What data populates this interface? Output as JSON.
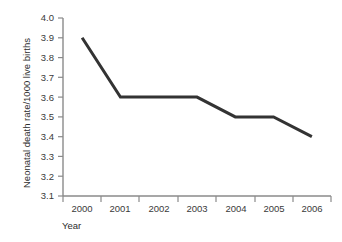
{
  "chart_data": {
    "type": "line",
    "title": "",
    "xlabel": "Year",
    "ylabel": "Neonatal death rate/1000 live births",
    "categories": [
      "2000",
      "2001",
      "2002",
      "2003",
      "2004",
      "2005",
      "2006"
    ],
    "values": [
      3.9,
      3.6,
      3.6,
      3.6,
      3.5,
      3.5,
      3.4
    ],
    "series": [
      {
        "name": "Neonatal death rate",
        "values": [
          3.9,
          3.6,
          3.6,
          3.6,
          3.5,
          3.5,
          3.4
        ]
      }
    ],
    "x": [
      2000,
      2001,
      2002,
      2003,
      2004,
      2005,
      2006
    ],
    "ylim": [
      3.1,
      4.0
    ],
    "ytick_labels": [
      "4.0",
      "3.9",
      "3.8",
      "3.7",
      "3.6",
      "3.5",
      "3.4",
      "3.3",
      "3.2",
      "3.1"
    ],
    "ytick_values": [
      4.0,
      3.9,
      3.8,
      3.7,
      3.6,
      3.5,
      3.4,
      3.3,
      3.2,
      3.1
    ],
    "ytick_step": 0.1,
    "grid": false,
    "legend": false,
    "legend_position": "none",
    "annotations": [],
    "colors": {
      "line": "#333333",
      "axis": "#8a8a8a",
      "text": "#3a3a3a",
      "background": "#ffffff"
    }
  }
}
